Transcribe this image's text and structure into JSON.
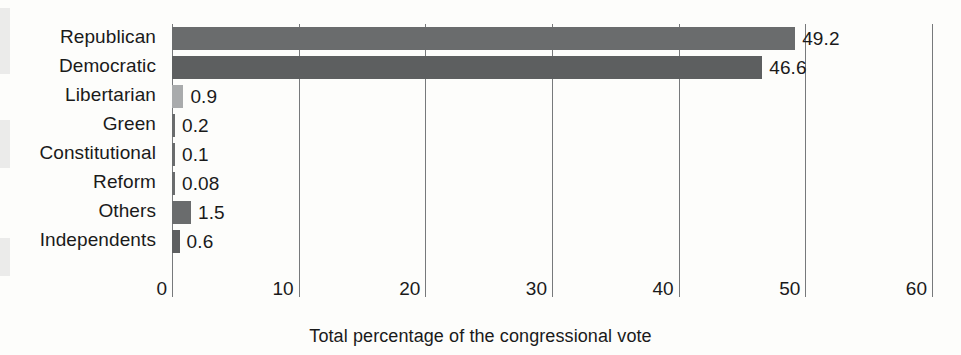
{
  "chart_data": {
    "type": "bar",
    "orientation": "horizontal",
    "title": "",
    "xlabel": "Total percentage of the congressional vote",
    "ylabel": "",
    "xlim": [
      0,
      60
    ],
    "xticks": [
      0,
      10,
      20,
      30,
      40,
      50,
      60
    ],
    "xtick_labels": [
      "0",
      "10",
      "20",
      "30",
      "40",
      "50",
      "60"
    ],
    "grid": "vertical gridlines at each x tick",
    "legend": "none",
    "categories": [
      "Republican",
      "Democratic",
      "Libertarian",
      "Green",
      "Constitutional",
      "Reform",
      "Others",
      "Independents"
    ],
    "values": [
      49.2,
      46.6,
      0.9,
      0.2,
      0.1,
      0.08,
      1.5,
      0.6
    ],
    "value_labels": [
      "49.2",
      "46.6",
      "0.9",
      "0.2",
      "0.1",
      "0.08",
      "1.5",
      "0.6"
    ],
    "bar_colors": [
      "#6a6c6d",
      "#5d5f60",
      "#a9abac",
      "#6a6c6d",
      "#6a6c6d",
      "#6a6c6d",
      "#6a6c6d",
      "#5d5f60"
    ]
  },
  "style": {
    "background": "#fdfdfb",
    "axis_color": "#77797b",
    "text_color": "#1a1a1a",
    "bar_default_color": "#6a6c6d"
  }
}
